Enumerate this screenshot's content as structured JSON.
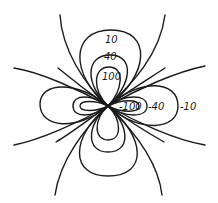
{
  "diagram": {
    "type": "contour-plot",
    "positive_labels": [
      "10",
      "40",
      "100"
    ],
    "negative_labels": [
      "-100",
      "-40",
      "-10"
    ],
    "line_color": "#1a1a1a",
    "background": "#ffffff"
  }
}
